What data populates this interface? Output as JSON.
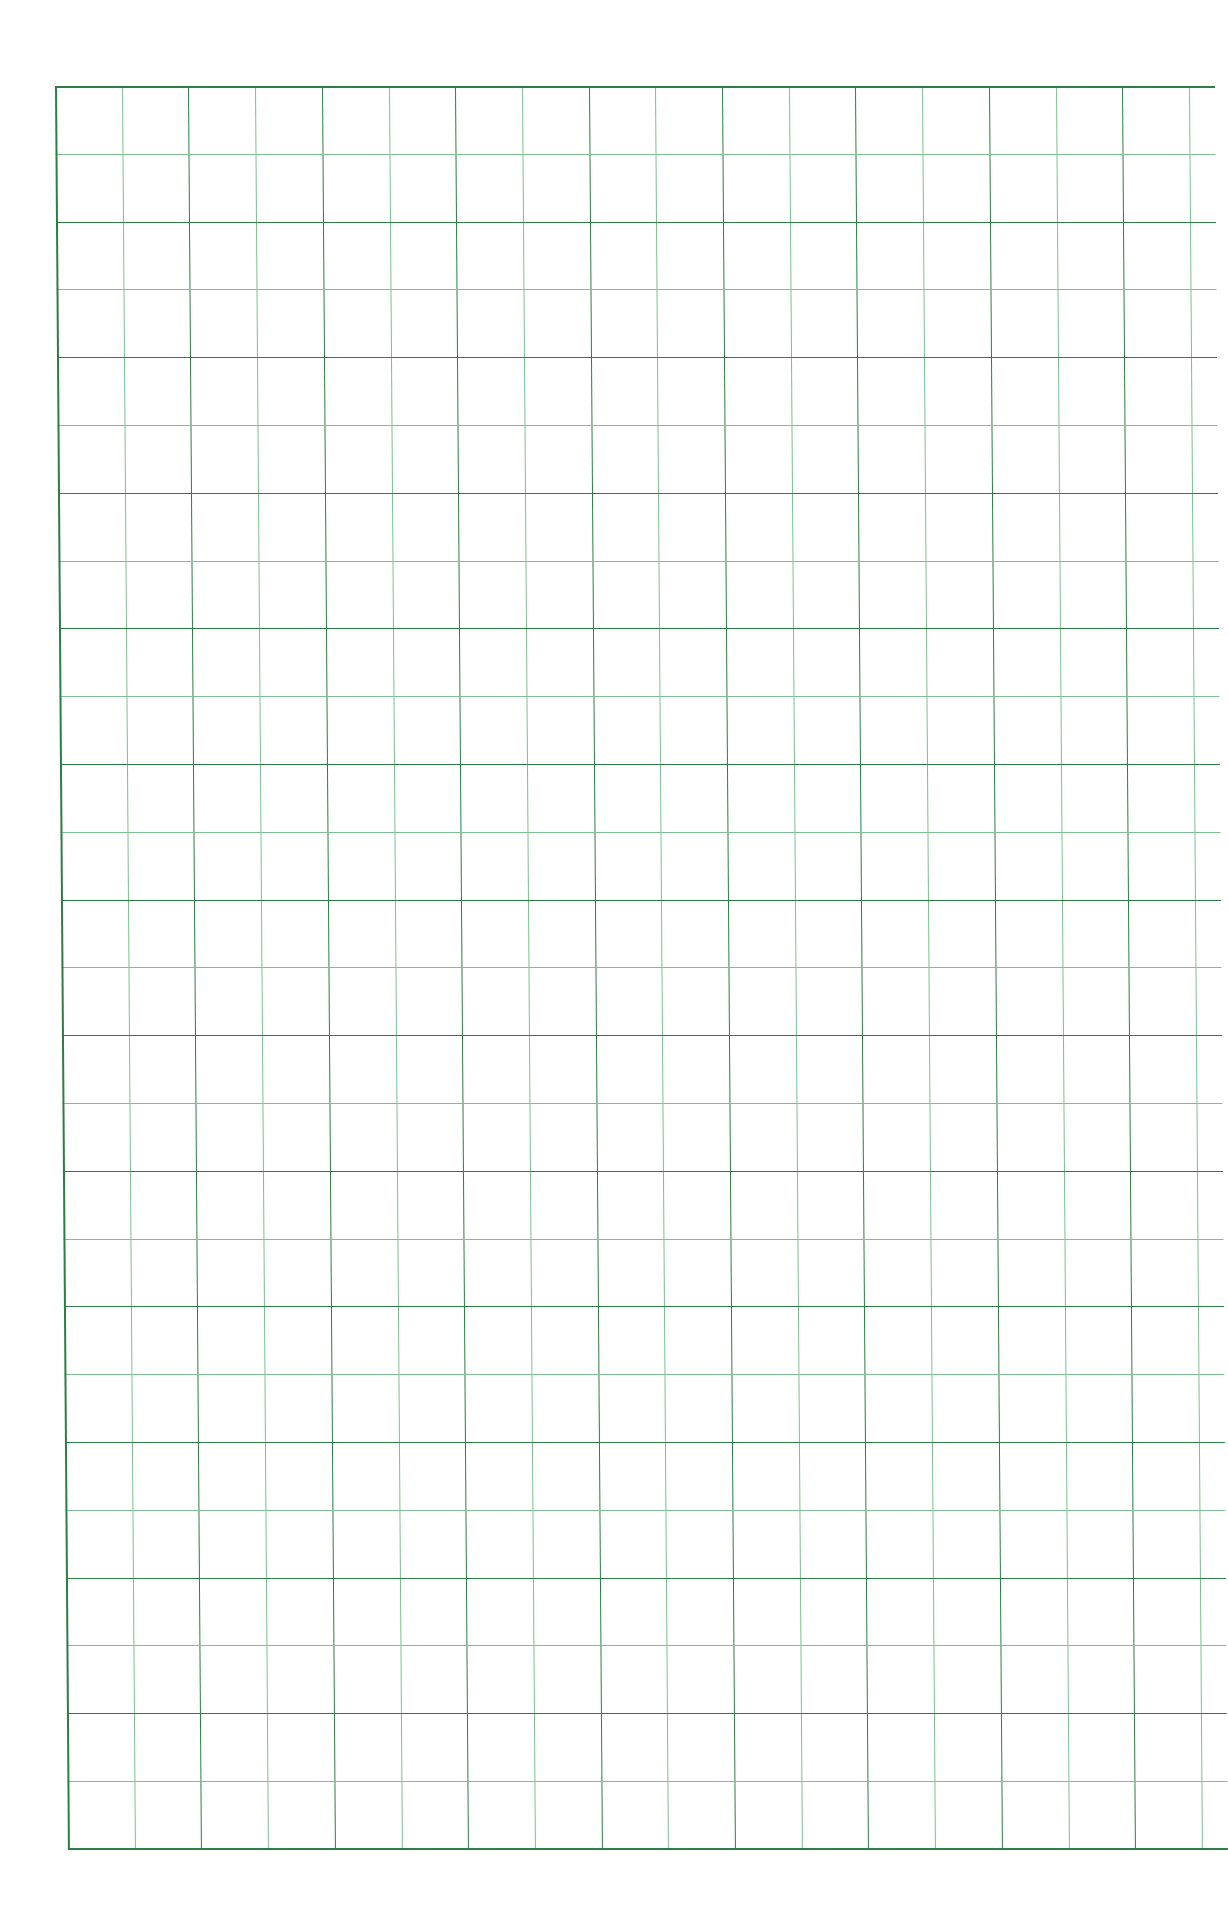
{
  "page": {
    "type": "graph-paper-sheet",
    "background_color": "#ffffff",
    "grid": {
      "major_line_color": "#2e7d45",
      "minor_line_color": "#7fbf92",
      "columns": 17,
      "rows": 26,
      "cell_width_px": 66.7,
      "cell_height_px": 67.8,
      "major_every": 2
    }
  }
}
